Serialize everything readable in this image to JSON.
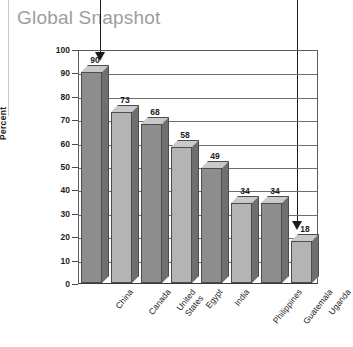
{
  "title": "Global Snapshot",
  "colors": {
    "title": "#9d9d9d",
    "bar_front_dark": "#8d8d8d",
    "bar_front_light": "#b4b4b4",
    "bar_top": "#c9c9c9",
    "bar_side": "#6f6f6f",
    "axis": "#5b5b5b",
    "text": "#1d1d1d",
    "annotation": "#1b1b1b"
  },
  "annotations": [
    {
      "name": "arrow-to-china-bar",
      "target": "China",
      "target_value": 90
    },
    {
      "name": "arrow-to-uganda-bar",
      "target": "Uganda",
      "target_value": 18
    }
  ],
  "chart_data": {
    "type": "bar",
    "title": "Global Snapshot",
    "xlabel": "",
    "ylabel": "Percent",
    "ylim": [
      0,
      100
    ],
    "yticks": [
      100,
      90,
      80,
      70,
      60,
      50,
      40,
      30,
      20,
      10,
      0
    ],
    "grid": true,
    "legend": null,
    "categories": [
      "China",
      "Canada",
      "United States",
      "Egypt",
      "India",
      "Philippines",
      "Guatemala",
      "Uganda"
    ],
    "category_lines": [
      [
        "China"
      ],
      [
        "Canada"
      ],
      [
        "United",
        "States"
      ],
      [
        "Egypt"
      ],
      [
        "India"
      ],
      [
        "Philippines"
      ],
      [
        "Guatemala"
      ],
      [
        "Uganda"
      ]
    ],
    "values": [
      90,
      73,
      68,
      58,
      49,
      34,
      34,
      18
    ],
    "value_labels": [
      "90",
      "73",
      "68",
      "58",
      "49",
      "34",
      "34",
      "18"
    ],
    "bar_shades": [
      "dark",
      "light",
      "dark",
      "light",
      "dark",
      "light",
      "dark",
      "light"
    ]
  }
}
